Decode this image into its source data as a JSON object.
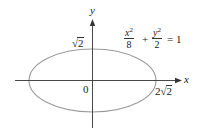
{
  "diagram": {
    "equation": {
      "term1_num": "x",
      "term1_exp": "2",
      "term1_den": "8",
      "plus": "+",
      "term2_num": "y",
      "term2_exp": "2",
      "term2_den": "2",
      "equals": "= 1"
    },
    "axes": {
      "x_label": "x",
      "y_label": "y",
      "origin_label": "0"
    },
    "ticks": {
      "y_intercept_radical": "√",
      "y_intercept_value": "2",
      "x_intercept_coef": "2",
      "x_intercept_radical": "√",
      "x_intercept_value": "2"
    },
    "colors": {
      "ellipse": "#9a9a9a",
      "axes": "#333333",
      "text": "#222222"
    }
  }
}
